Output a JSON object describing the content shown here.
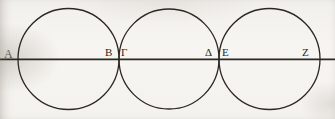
{
  "figure": {
    "background_color": "#f6f4f0",
    "ink_color": "#2b2723",
    "stroke_width": 1.3,
    "width": 335,
    "height": 119,
    "baseline_y": 59,
    "diameter_line": {
      "x_start": 0,
      "x_end": 335,
      "y": 59
    },
    "circles": [
      {
        "name": "circle-left",
        "cx": 68.5,
        "cy": 59,
        "r": 50.5,
        "left_point": "Α",
        "right_point": "Β"
      },
      {
        "name": "circle-middle",
        "cx": 169.0,
        "cy": 59,
        "r": 50.0,
        "left_point": "Γ",
        "right_point": "Δ"
      },
      {
        "name": "circle-right",
        "cx": 269.5,
        "cy": 59,
        "r": 50.5,
        "left_point": "Ε",
        "right_point": "Ζ"
      }
    ],
    "labels": [
      {
        "id": "A",
        "text": "Α",
        "x": 4,
        "y": 48,
        "note": "left endpoint of first circle, faded at page edge"
      },
      {
        "id": "B",
        "text": "Β",
        "x": 105,
        "y": 47,
        "note": "first tangency, left side"
      },
      {
        "id": "G",
        "text": "Γ",
        "x": 121,
        "y": 47,
        "note": "first tangency, right side"
      },
      {
        "id": "D",
        "text": "Δ",
        "x": 205,
        "y": 47,
        "note": "second tangency, left side"
      },
      {
        "id": "E",
        "text": "Ε",
        "x": 222,
        "y": 47,
        "note": "second tangency, right side"
      },
      {
        "id": "Z",
        "text": "Ζ",
        "x": 302,
        "y": 47,
        "note": "right endpoint of third circle"
      }
    ],
    "tangent_points": [
      {
        "name": "tangency-b-gamma",
        "x": 119,
        "y": 59
      },
      {
        "name": "tangency-delta-epsilon",
        "x": 219.5,
        "y": 59
      }
    ]
  }
}
